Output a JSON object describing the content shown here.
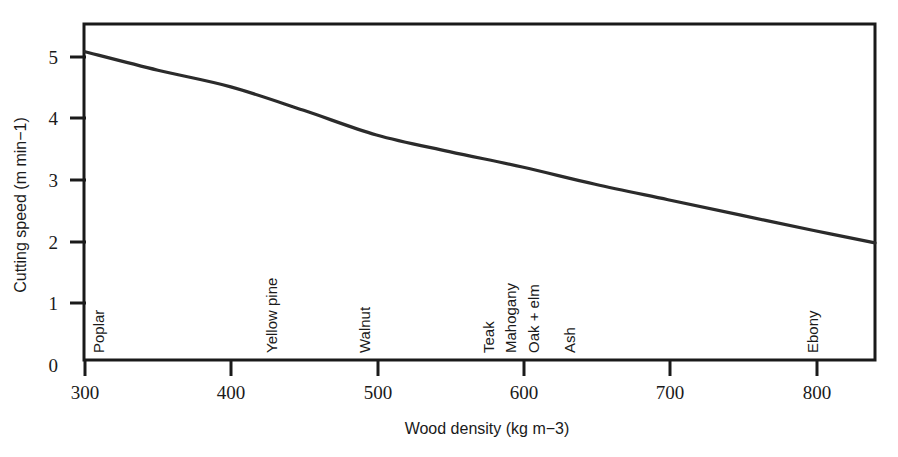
{
  "chart_data": {
    "type": "line",
    "title": "",
    "xlabel": "Wood density (kg m−3)",
    "ylabel": "Cutting speed (m min−1)",
    "xlim": [
      300,
      842
    ],
    "ylim": [
      0,
      5.45
    ],
    "grid": false,
    "legend": "none",
    "xticks": [
      300,
      400,
      500,
      600,
      700,
      800
    ],
    "xtick_labels": [
      "300",
      "400",
      "500",
      "600",
      "700",
      "800"
    ],
    "yticks": [
      0,
      1,
      2,
      3,
      4,
      5
    ],
    "ytick_labels": [
      "0",
      "1",
      "2",
      "3",
      "4",
      "5"
    ],
    "series": [
      {
        "name": "Cutting speed vs wood density",
        "x": [
          300,
          350,
          400,
          450,
          500,
          550,
          600,
          650,
          700,
          750,
          800,
          842
        ],
        "values": [
          5.0,
          4.7,
          4.43,
          4.05,
          3.65,
          3.38,
          3.13,
          2.85,
          2.6,
          2.35,
          2.1,
          1.9
        ]
      }
    ],
    "annotations": [
      {
        "label": "Poplar",
        "x": 302
      },
      {
        "label": "Yellow pine",
        "x": 432
      },
      {
        "label": "Walnut",
        "x": 503
      },
      {
        "label": "Teak",
        "x": 579
      },
      {
        "label": "Mahogany",
        "x": 594
      },
      {
        "label": "Oak + elm",
        "x": 610
      },
      {
        "label": "Ash",
        "x": 635
      },
      {
        "label": "Ebony",
        "x": 799
      }
    ]
  },
  "colors": {
    "curve": "#2b2b2b",
    "axis": "#1a1a1a",
    "background": "#ffffff"
  }
}
